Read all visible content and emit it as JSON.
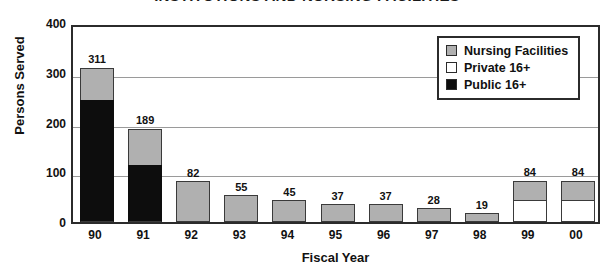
{
  "chart_data": {
    "type": "bar",
    "subtype": "stacked-bar",
    "title": "INSTITUTIONS AND NURSING FACILITIES",
    "xlabel": "Fiscal Year",
    "ylabel": "Persons Served",
    "categories": [
      "90",
      "91",
      "92",
      "93",
      "94",
      "95",
      "96",
      "97",
      "98",
      "99",
      "00"
    ],
    "ylim": [
      0,
      400
    ],
    "yticks": [
      400,
      300,
      200,
      100,
      0
    ],
    "grid": true,
    "grid_axis": "y",
    "legend_position": "top-right",
    "series": [
      {
        "name": "Nursing Facilities",
        "color": "#b0b0b0",
        "values": [
          66,
          74,
          82,
          55,
          45,
          37,
          37,
          28,
          19,
          39,
          40
        ]
      },
      {
        "name": "Private 16+",
        "color": "#ffffff",
        "values": [
          0,
          0,
          0,
          0,
          0,
          0,
          0,
          0,
          0,
          45,
          44
        ]
      },
      {
        "name": "Public 16+",
        "color": "#000000",
        "values": [
          245,
          115,
          0,
          0,
          0,
          0,
          0,
          0,
          0,
          0,
          0
        ]
      }
    ],
    "totals": [
      311,
      189,
      82,
      55,
      45,
      37,
      37,
      28,
      19,
      84,
      84
    ],
    "data_labels": [
      "311",
      "189",
      "82",
      "55",
      "45",
      "37",
      "37",
      "28",
      "19",
      "84",
      "84"
    ]
  },
  "legend": {
    "items": [
      {
        "label": "Nursing Facilities",
        "swatch": "nursing-facilities-swatch"
      },
      {
        "label": "Private 16+",
        "swatch": "private-16-plus-swatch"
      },
      {
        "label": "Public 16+",
        "swatch": "public-16-plus-swatch"
      }
    ]
  },
  "colors": {
    "nursing_facilities": "#b0b0b0",
    "private": "#ffffff",
    "public": "#000000",
    "axis": "#2b2b2b",
    "gridline": "#9a9a9a",
    "text": "#111111"
  }
}
